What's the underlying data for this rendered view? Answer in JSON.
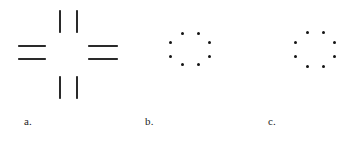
{
  "figure": {
    "background_color": "#ffffff",
    "stroke_color": "#2a2a2a",
    "dot_color": "#141414",
    "label_color": "#1d1d1d",
    "width": 362,
    "height": 145,
    "panels": [
      {
        "id": "a",
        "label": "a.",
        "label_x": 24,
        "label_y": 116,
        "kind": "line-segments",
        "description": "four pairs of parallel line segments arranged around an empty center forming an illusory cross",
        "segments": [
          {
            "name": "top-left-vertical",
            "orientation": "vertical",
            "x": 59,
            "y": 10,
            "length": 23
          },
          {
            "name": "top-right-vertical",
            "orientation": "vertical",
            "x": 76,
            "y": 10,
            "length": 23
          },
          {
            "name": "left-upper-horizontal",
            "orientation": "horizontal",
            "x": 18,
            "y": 45,
            "length": 28
          },
          {
            "name": "left-lower-horizontal",
            "orientation": "horizontal",
            "x": 18,
            "y": 58,
            "length": 28
          },
          {
            "name": "right-upper-horizontal",
            "orientation": "horizontal",
            "x": 88,
            "y": 45,
            "length": 30
          },
          {
            "name": "right-lower-horizontal",
            "orientation": "horizontal",
            "x": 88,
            "y": 58,
            "length": 30
          },
          {
            "name": "bottom-left-vertical",
            "orientation": "vertical",
            "x": 59,
            "y": 76,
            "length": 23
          },
          {
            "name": "bottom-right-vertical",
            "orientation": "vertical",
            "x": 76,
            "y": 76,
            "length": 23
          }
        ]
      },
      {
        "id": "b",
        "label": "b.",
        "label_x": 145,
        "label_y": 116,
        "kind": "dot-ring",
        "description": "eight dots arranged in a ring suggesting an illusory circle",
        "dot_count": 8,
        "dots": [
          {
            "name": "dot-top-left",
            "x": 181,
            "y": 32
          },
          {
            "name": "dot-top-right",
            "x": 197,
            "y": 32
          },
          {
            "name": "dot-left-upper",
            "x": 169,
            "y": 41
          },
          {
            "name": "dot-right-upper",
            "x": 208,
            "y": 41
          },
          {
            "name": "dot-left-lower",
            "x": 169,
            "y": 55
          },
          {
            "name": "dot-right-lower",
            "x": 208,
            "y": 55
          },
          {
            "name": "dot-bottom-left",
            "x": 181,
            "y": 63
          },
          {
            "name": "dot-bottom-right",
            "x": 197,
            "y": 63
          }
        ]
      },
      {
        "id": "c",
        "label": "c.",
        "label_x": 268,
        "label_y": 116,
        "kind": "dot-ring",
        "description": "eight dots arranged in a slightly narrower ring suggesting an illusory circle",
        "dot_count": 8,
        "dots": [
          {
            "name": "dot-top-left",
            "x": 306,
            "y": 31
          },
          {
            "name": "dot-top-right",
            "x": 322,
            "y": 31
          },
          {
            "name": "dot-left-upper",
            "x": 294,
            "y": 41
          },
          {
            "name": "dot-right-upper",
            "x": 333,
            "y": 41
          },
          {
            "name": "dot-left-lower",
            "x": 294,
            "y": 55
          },
          {
            "name": "dot-right-lower",
            "x": 333,
            "y": 55
          },
          {
            "name": "dot-bottom-left",
            "x": 306,
            "y": 65
          },
          {
            "name": "dot-bottom-right",
            "x": 322,
            "y": 65
          }
        ]
      }
    ]
  }
}
